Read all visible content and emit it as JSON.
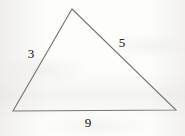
{
  "figure": {
    "kind": "triangle-diagram",
    "background_color": "#fdfdfc",
    "stroke_color": "#777777",
    "label_color": "#2b2b2b",
    "stroke_width": 1.1,
    "canvas": {
      "width": 185,
      "height": 136
    }
  },
  "chart_data": {
    "type": "diagram",
    "title": "",
    "shape": "triangle",
    "vertices": [
      {
        "name": "apex",
        "x": 72,
        "y": 9
      },
      {
        "name": "bottom-right",
        "x": 176,
        "y": 110
      },
      {
        "name": "bottom-left",
        "x": 13,
        "y": 111
      }
    ],
    "sides": [
      {
        "name": "left-side",
        "value": "3",
        "from": "bottom-left",
        "to": "apex",
        "label_x": 31,
        "label_y": 53
      },
      {
        "name": "right-side",
        "value": "5",
        "from": "apex",
        "to": "bottom-right",
        "label_x": 122,
        "label_y": 42
      },
      {
        "name": "base",
        "value": "9",
        "from": "bottom-left",
        "to": "bottom-right",
        "label_x": 88,
        "label_y": 122
      }
    ],
    "labels": [
      "3",
      "5",
      "9"
    ]
  }
}
